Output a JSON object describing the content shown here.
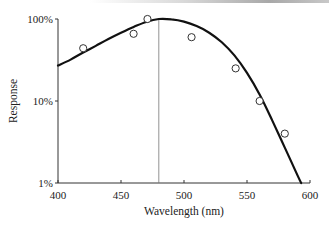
{
  "chart_data": {
    "type": "line",
    "title": "",
    "xlabel": "Wavelength (nm)",
    "ylabel": "Response",
    "xlim": [
      400,
      600
    ],
    "ylim": [
      1,
      100
    ],
    "yscale": "log",
    "x_ticks": [
      400,
      450,
      500,
      550,
      600
    ],
    "x_tick_labels": [
      "400",
      "450",
      "500",
      "550",
      "600"
    ],
    "y_ticks": [
      1,
      10,
      100
    ],
    "y_tick_labels": [
      "1%",
      "10%",
      "100%"
    ],
    "grid": false,
    "legend": "none",
    "reference_line": {
      "x": 480,
      "label": ""
    },
    "series": [
      {
        "name": "Fitted response curve",
        "style": "line",
        "x": [
          400,
          410,
          420,
          430,
          440,
          450,
          460,
          470,
          480,
          490,
          500,
          510,
          520,
          530,
          540,
          550,
          560,
          570,
          580,
          590,
          593
        ],
        "values": [
          27,
          32,
          39,
          47,
          57,
          68,
          80,
          92,
          100,
          99,
          93,
          82,
          68,
          52,
          36,
          22,
          12,
          5.8,
          2.7,
          1.25,
          1
        ]
      },
      {
        "name": "Measured points",
        "style": "scatter-open-circle",
        "x": [
          420,
          460,
          471,
          506,
          541,
          560,
          580
        ],
        "values": [
          44,
          66,
          100,
          60,
          25,
          10,
          4
        ]
      }
    ]
  }
}
